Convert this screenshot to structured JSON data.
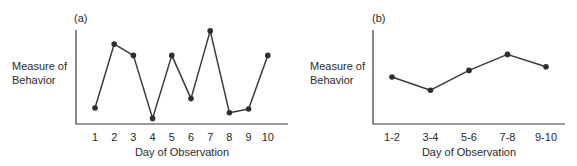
{
  "chart_data": [
    {
      "panel_label": "(a)",
      "type": "line",
      "title": "",
      "xlabel": "Day of Observation",
      "ylabel": "Measure of Behavior",
      "ylabel_lines": [
        "Measure of",
        "Behavior"
      ],
      "categories": [
        "1",
        "2",
        "3",
        "4",
        "5",
        "6",
        "7",
        "8",
        "9",
        "10"
      ],
      "values": [
        1.7,
        8.5,
        7.3,
        0.6,
        7.3,
        2.7,
        9.9,
        1.2,
        1.6,
        7.3
      ],
      "ylim": [
        0,
        10
      ],
      "y_ticks": "none",
      "grid": false,
      "legend": "none",
      "markers": true
    },
    {
      "panel_label": "(b)",
      "type": "line",
      "title": "",
      "xlabel": "Day of Observation",
      "ylabel": "Measure of Behavior",
      "ylabel_lines": [
        "Measure of",
        "Behavior"
      ],
      "categories": [
        "1-2",
        "3-4",
        "5-6",
        "7-8",
        "9-10"
      ],
      "values": [
        5.0,
        3.6,
        5.7,
        7.4,
        6.1
      ],
      "ylim": [
        0,
        10
      ],
      "y_ticks": "none",
      "grid": false,
      "legend": "none",
      "markers": true
    }
  ],
  "colors": {
    "line": "#3a3a3a",
    "marker": "#2e2e2e",
    "text": "#2a2a2a",
    "background": "#ffffff"
  }
}
